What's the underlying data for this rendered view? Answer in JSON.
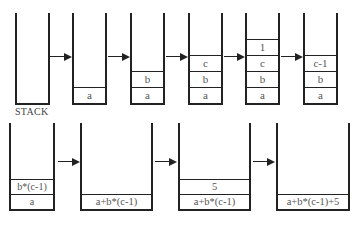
{
  "diagram": {
    "label": "STACK",
    "top_row": [
      {
        "items": []
      },
      {
        "items": [
          "a"
        ]
      },
      {
        "items": [
          "a",
          "b"
        ]
      },
      {
        "items": [
          "a",
          "b",
          "c"
        ]
      },
      {
        "items": [
          "a",
          "b",
          "c",
          "1"
        ]
      },
      {
        "items": [
          "a",
          "b",
          "c-1"
        ]
      }
    ],
    "bottom_row": [
      {
        "items": [
          "a",
          "b*(c-1)"
        ]
      },
      {
        "items": [
          "a+b*(c-1)"
        ]
      },
      {
        "items": [
          "a+b*(c-1)",
          "5"
        ]
      },
      {
        "items": [
          "a+b*(c-1)+5"
        ]
      }
    ]
  }
}
